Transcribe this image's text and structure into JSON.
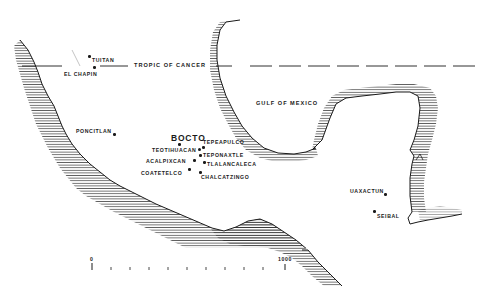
{
  "map": {
    "type": "schematic regional map",
    "region": "Mesoamerica",
    "colors": {
      "ink": "#1a1a1a",
      "background": "#ffffff"
    },
    "reference_line": {
      "label": "TROPIC OF CANCER"
    },
    "water_labels": [
      {
        "id": "gulf",
        "label": "GULF OF MEXICO"
      }
    ],
    "sites": [
      {
        "id": "tuitan",
        "label": "TUITAN"
      },
      {
        "id": "el-chapin",
        "label": "EL CHAPIN"
      },
      {
        "id": "poncitlan",
        "label": "PONCITLAN"
      },
      {
        "id": "bocto",
        "label": "BOCTO"
      },
      {
        "id": "teotihuacan",
        "label": "TEOTIHUACAN"
      },
      {
        "id": "tepeapulco",
        "label": "TEPEAPULCO"
      },
      {
        "id": "teponaxtle",
        "label": "TEPONAXTLE"
      },
      {
        "id": "acalpixcan",
        "label": "ACALPIXCAN"
      },
      {
        "id": "tlalancaleca",
        "label": "TLALANCALECA"
      },
      {
        "id": "coatetelco",
        "label": "COATETELCO"
      },
      {
        "id": "chalcatzingo",
        "label": "CHALCATZINGO"
      },
      {
        "id": "uaxactun",
        "label": "UAXACTUN"
      },
      {
        "id": "seibal",
        "label": "SEIBAL"
      }
    ],
    "scale_bar": {
      "start_label": "0",
      "end_label": "1000",
      "ticks": 11
    }
  }
}
